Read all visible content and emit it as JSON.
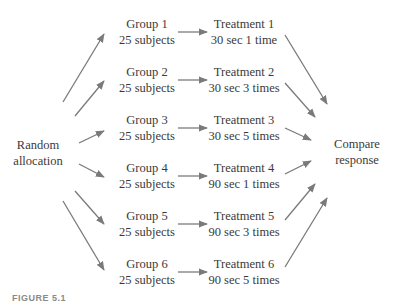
{
  "source": {
    "line1": "Random",
    "line2": "allocation"
  },
  "groups": [
    {
      "name": "Group 1",
      "size": "25 subjects"
    },
    {
      "name": "Group 2",
      "size": "25 subjects"
    },
    {
      "name": "Group 3",
      "size": "25 subjects"
    },
    {
      "name": "Group 4",
      "size": "25 subjects"
    },
    {
      "name": "Group 5",
      "size": "25 subjects"
    },
    {
      "name": "Group 6",
      "size": "25 subjects"
    }
  ],
  "treatments": [
    {
      "name": "Treatment 1",
      "detail": "30 sec 1 time"
    },
    {
      "name": "Treatment 2",
      "detail": "30 sec 3 times"
    },
    {
      "name": "Treatment 3",
      "detail": "30 sec 5 times"
    },
    {
      "name": "Treatment 4",
      "detail": "90 sec 1 times"
    },
    {
      "name": "Treatment 5",
      "detail": "90 sec 3 times"
    },
    {
      "name": "Treatment 6",
      "detail": "90 sec 5 times"
    }
  ],
  "outcome": {
    "line1": "Compare",
    "line2": "response"
  },
  "caption": "FIGURE 5.1",
  "colors": {
    "arrow": "#7a7a7a",
    "text": "#3a3a3a"
  }
}
